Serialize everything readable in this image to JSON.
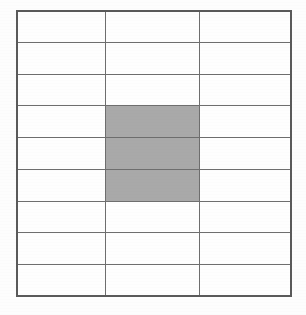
{
  "figure": {
    "type": "table-grid",
    "columns": 3,
    "rows": 9,
    "background_color": "#fdfdfd",
    "cell_fill_color": "#fefefe",
    "grid_line_color": "#6e6e6e",
    "outer_border_color": "#5a5a5a",
    "shaded_cell_color": "#a9a9a9",
    "shaded_cells": [
      {
        "row": 4,
        "column": 2
      },
      {
        "row": 5,
        "column": 2
      },
      {
        "row": 6,
        "column": 2
      }
    ],
    "cells": [
      [
        {
          "shaded": false,
          "label": ""
        },
        {
          "shaded": false,
          "label": ""
        },
        {
          "shaded": false,
          "label": ""
        }
      ],
      [
        {
          "shaded": false,
          "label": ""
        },
        {
          "shaded": false,
          "label": ""
        },
        {
          "shaded": false,
          "label": ""
        }
      ],
      [
        {
          "shaded": false,
          "label": ""
        },
        {
          "shaded": false,
          "label": ""
        },
        {
          "shaded": false,
          "label": ""
        }
      ],
      [
        {
          "shaded": false,
          "label": ""
        },
        {
          "shaded": true,
          "label": ""
        },
        {
          "shaded": false,
          "label": ""
        }
      ],
      [
        {
          "shaded": false,
          "label": ""
        },
        {
          "shaded": true,
          "label": ""
        },
        {
          "shaded": false,
          "label": ""
        }
      ],
      [
        {
          "shaded": false,
          "label": ""
        },
        {
          "shaded": true,
          "label": ""
        },
        {
          "shaded": false,
          "label": ""
        }
      ],
      [
        {
          "shaded": false,
          "label": ""
        },
        {
          "shaded": false,
          "label": ""
        },
        {
          "shaded": false,
          "label": ""
        }
      ],
      [
        {
          "shaded": false,
          "label": ""
        },
        {
          "shaded": false,
          "label": ""
        },
        {
          "shaded": false,
          "label": ""
        }
      ],
      [
        {
          "shaded": false,
          "label": ""
        },
        {
          "shaded": false,
          "label": ""
        },
        {
          "shaded": false,
          "label": ""
        }
      ]
    ],
    "column_width_fractions": [
      0.322,
      0.345,
      0.333
    ]
  }
}
